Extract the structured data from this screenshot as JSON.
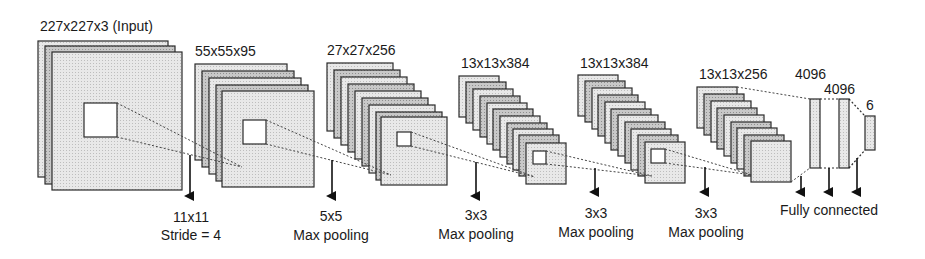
{
  "layers": [
    {
      "id": "input",
      "dims": "227x227x3 (Input)"
    },
    {
      "id": "conv1",
      "dims": "55x55x95"
    },
    {
      "id": "conv2",
      "dims": "27x27x256"
    },
    {
      "id": "conv3",
      "dims": "13x13x384"
    },
    {
      "id": "conv4",
      "dims": "13x13x384"
    },
    {
      "id": "conv5",
      "dims": "13x13x256"
    },
    {
      "id": "fc6",
      "dims": "4096"
    },
    {
      "id": "fc7",
      "dims": "4096"
    },
    {
      "id": "fc8",
      "dims": "6"
    }
  ],
  "operations": [
    {
      "line1": "11x11",
      "line2": "Stride = 4"
    },
    {
      "line1": "5x5",
      "line2": "Max pooling"
    },
    {
      "line1": "3x3",
      "line2": "Max pooling"
    },
    {
      "line1": "3x3",
      "line2": "Max pooling"
    },
    {
      "line1": "3x3",
      "line2": "Max pooling"
    },
    {
      "line1": "Fully connected"
    }
  ],
  "colors": {
    "block_fill_light": "#e6e6e6",
    "block_fill_dark": "#c4c4c4",
    "stroke": "#2a2a2a",
    "kernel_fill": "#ffffff"
  }
}
